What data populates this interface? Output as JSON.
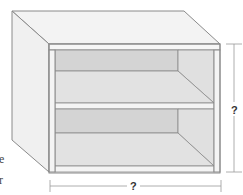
{
  "diagram": {
    "dimension_labels": {
      "height": "?",
      "width": "?"
    },
    "cropped_text_fragments": [
      "e",
      "r"
    ],
    "colors": {
      "background": "#ffffff",
      "outline": "#8a8a8a",
      "top_surface": "#f3f3f3",
      "side_panel": "#f0f0f0",
      "back_panel": "#d4d4d4",
      "shelf_floor": "#e2e2e2",
      "inner_side": "#e0e0e0",
      "frame": "#f4f4f4",
      "dimension_line": "#9a9a9a"
    }
  }
}
